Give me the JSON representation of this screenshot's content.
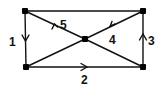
{
  "diagram": {
    "type": "directed-graph",
    "nodes": [
      {
        "id": "top-left",
        "x": 25,
        "y": 11
      },
      {
        "id": "top-right",
        "x": 143,
        "y": 11
      },
      {
        "id": "bottom-left",
        "x": 26,
        "y": 67
      },
      {
        "id": "bottom-right",
        "x": 143,
        "y": 67
      },
      {
        "id": "center",
        "x": 85,
        "y": 39
      }
    ],
    "edges": [
      {
        "from": "top-left",
        "to": "top-right",
        "label": "",
        "arrow": false
      },
      {
        "from": "top-left",
        "to": "bottom-left",
        "label": "1",
        "arrow": true
      },
      {
        "from": "bottom-left",
        "to": "bottom-right",
        "label": "2",
        "arrow": true
      },
      {
        "from": "bottom-right",
        "to": "top-right",
        "label": "3",
        "arrow": true
      },
      {
        "from": "top-right",
        "to": "center",
        "label": "4",
        "arrow": true
      },
      {
        "from": "center",
        "to": "top-left",
        "label": "5",
        "arrow": true
      },
      {
        "from": "center",
        "to": "bottom-left",
        "label": "",
        "arrow": false
      },
      {
        "from": "center",
        "to": "bottom-right",
        "label": "",
        "arrow": false
      }
    ],
    "labels": {
      "e1": "1",
      "e2": "2",
      "e3": "3",
      "e4": "4",
      "e5": "5"
    },
    "colors": {
      "line": "#111111",
      "node": "#000000",
      "background": "#ffffff"
    }
  }
}
